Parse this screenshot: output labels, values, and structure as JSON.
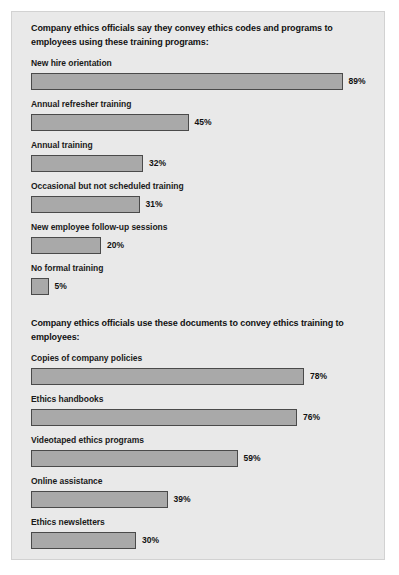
{
  "chart_data": [
    {
      "type": "bar",
      "orientation": "horizontal",
      "title": "Company ethics officials say they convey ethics codes and programs to employees using these training programs:",
      "xlabel": "",
      "ylabel": "",
      "xlim": [
        0,
        100
      ],
      "grid": false,
      "legend": "none",
      "value_suffix": "%",
      "categories": [
        "New hire orientation",
        "Annual refresher training",
        "Annual training",
        "Occasional but not scheduled training",
        "New employee follow-up sessions",
        "No formal training"
      ],
      "values": [
        89,
        45,
        32,
        31,
        20,
        5
      ],
      "value_labels": [
        "89%",
        "45%",
        "32%",
        "31%",
        "20%",
        "5%"
      ]
    },
    {
      "type": "bar",
      "orientation": "horizontal",
      "title": "Company ethics officials use these documents to convey ethics training to employees:",
      "xlabel": "",
      "ylabel": "",
      "xlim": [
        0,
        100
      ],
      "grid": false,
      "legend": "none",
      "value_suffix": "%",
      "categories": [
        "Copies of company policies",
        "Ethics handbooks",
        "Videotaped ethics programs",
        "Online assistance",
        "Ethics newsletters"
      ],
      "values": [
        78,
        76,
        59,
        39,
        30
      ],
      "value_labels": [
        "78%",
        "76%",
        "59%",
        "39%",
        "30%"
      ]
    }
  ],
  "colors": {
    "page_background": "#ffffff",
    "panel_background": "#e9e9e9",
    "bar_fill": "#a9a9a9",
    "bar_border": "#4a4a4a",
    "text": "#111111"
  }
}
